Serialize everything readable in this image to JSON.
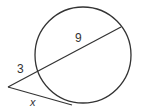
{
  "diagram": {
    "type": "secant-tangent-circle",
    "colors": {
      "stroke": "#333333",
      "background": "#ffffff",
      "text": "#333333"
    },
    "circle": {
      "cx": 83,
      "cy": 55,
      "r": 48
    },
    "external_point": {
      "x": 8,
      "y": 87
    },
    "secant": {
      "entry": {
        "x": 37,
        "y": 71
      },
      "exit": {
        "x": 121,
        "y": 27
      },
      "external_segment_label": "3",
      "internal_segment_label": "9"
    },
    "tangent": {
      "touch_point": {
        "x": 72,
        "y": 105
      },
      "label": "x"
    },
    "labels": {
      "external": {
        "text": "3",
        "x": 21,
        "y": 73
      },
      "internal": {
        "text": "9",
        "x": 79,
        "y": 42
      },
      "tangent": {
        "text": "x",
        "x": 33,
        "y": 107
      }
    }
  }
}
